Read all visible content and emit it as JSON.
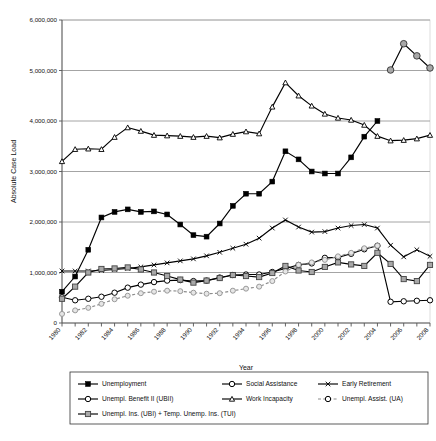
{
  "chart_data": {
    "type": "line",
    "title": "",
    "xlabel": "Year",
    "ylabel": "Absolute Case Load",
    "xlim": [
      1980,
      2008
    ],
    "ylim": [
      0,
      6000000
    ],
    "grid": true,
    "legend_position": "bottom",
    "y_ticks": [
      0,
      1000000,
      2000000,
      3000000,
      4000000,
      5000000,
      6000000
    ],
    "y_tick_labels": [
      "0",
      "1,000,000",
      "2,000,000",
      "3,000,000",
      "4,000,000",
      "5,000,000",
      "6,000,000"
    ],
    "x_ticks": [
      1980,
      1981,
      1982,
      1983,
      1984,
      1985,
      1986,
      1987,
      1988,
      1989,
      1990,
      1991,
      1992,
      1993,
      1994,
      1995,
      1996,
      1997,
      1998,
      1999,
      2000,
      2001,
      2002,
      2003,
      2004,
      2005,
      2006,
      2007,
      2008
    ],
    "x_tick_labels": [
      "1980",
      "1982",
      "1984",
      "1986",
      "1988",
      "1990",
      "1992",
      "1994",
      "1996",
      "1998",
      "2000",
      "2002",
      "2004",
      "2006",
      "2008"
    ],
    "x_labeled_years": [
      1980,
      1982,
      1984,
      1986,
      1988,
      1990,
      1992,
      1994,
      1996,
      1998,
      2000,
      2002,
      2004,
      2006,
      2008
    ],
    "series": [
      {
        "name": "Unemployment",
        "marker": "filled-square",
        "dash": "none",
        "color": "#000000",
        "x": [
          1980,
          1981,
          1982,
          1983,
          1984,
          1985,
          1986,
          1987,
          1988,
          1989,
          1990,
          1991,
          1992,
          1993,
          1994,
          1995,
          1996,
          1997,
          1998,
          1999,
          2000,
          2001,
          2002,
          2003,
          2004
        ],
        "values": [
          620000,
          920000,
          1450000,
          2090000,
          2200000,
          2250000,
          2200000,
          2210000,
          2150000,
          1950000,
          1740000,
          1710000,
          1970000,
          2320000,
          2560000,
          2560000,
          2800000,
          3400000,
          3240000,
          3000000,
          2960000,
          2960000,
          3280000,
          3690000,
          4000000
        ]
      },
      {
        "name": "Social Assistance",
        "marker": "open-circle",
        "dash": "none",
        "color": "#000000",
        "x": [
          1980,
          1981,
          1982,
          1983,
          1984,
          1985,
          1986,
          1987,
          1988,
          1989,
          1990,
          1991,
          1992,
          1993,
          1994,
          1995,
          1996,
          1997,
          1998,
          1999,
          2000,
          2001,
          2002,
          2003,
          2004,
          2005,
          2006,
          2007,
          2008
        ],
        "values": [
          510000,
          450000,
          480000,
          520000,
          600000,
          700000,
          760000,
          810000,
          840000,
          850000,
          830000,
          840000,
          900000,
          950000,
          960000,
          960000,
          1010000,
          1080000,
          1150000,
          1180000,
          1290000,
          1300000,
          1370000,
          1460000,
          1530000,
          420000,
          430000,
          440000,
          450000
        ]
      },
      {
        "name": "Early Retirement",
        "marker": "cross-bar",
        "dash": "none",
        "color": "#000000",
        "x": [
          1980,
          1981,
          1982,
          1983,
          1984,
          1985,
          1986,
          1987,
          1988,
          1989,
          1990,
          1991,
          1992,
          1993,
          1994,
          1995,
          1996,
          1997,
          1998,
          1999,
          2000,
          2001,
          2002,
          2003,
          2004,
          2005,
          2006,
          2007,
          2008
        ],
        "values": [
          1030000,
          1030000,
          1030000,
          1040000,
          1060000,
          1080000,
          1110000,
          1150000,
          1190000,
          1230000,
          1270000,
          1330000,
          1400000,
          1480000,
          1560000,
          1680000,
          1880000,
          2040000,
          1900000,
          1800000,
          1810000,
          1880000,
          1930000,
          1950000,
          1880000,
          1540000,
          1310000,
          1450000,
          1320000
        ]
      },
      {
        "name": "Unempl. Benefit II (UBII)",
        "marker": "gray-circle",
        "dash": "none",
        "color": "#000000",
        "x": [
          2005,
          2006,
          2007,
          2008
        ],
        "values": [
          5010000,
          5530000,
          5290000,
          5050000
        ]
      },
      {
        "name": "Work Incapacity",
        "marker": "small-open-square",
        "dash": "none",
        "color": "#000000",
        "x": [
          1980,
          1981,
          1982,
          1983,
          1984,
          1985,
          1986,
          1987,
          1988,
          1989,
          1990,
          1991,
          1992,
          1993,
          1994,
          1995,
          1996,
          1997,
          1998,
          1999,
          2000,
          2001,
          2002,
          2003,
          2004,
          2005,
          2006,
          2007,
          2008
        ],
        "values": [
          3200000,
          3440000,
          3450000,
          3440000,
          3680000,
          3870000,
          3800000,
          3720000,
          3710000,
          3700000,
          3680000,
          3700000,
          3670000,
          3740000,
          3790000,
          3750000,
          4280000,
          4760000,
          4500000,
          4300000,
          4140000,
          4060000,
          4020000,
          3920000,
          3700000,
          3610000,
          3620000,
          3650000,
          3720000
        ]
      },
      {
        "name": "Unempl. Assist. (UA)",
        "marker": "gray-circle-small",
        "dash": "dashed",
        "color": "#000000",
        "x": [
          1980,
          1981,
          1982,
          1983,
          1984,
          1985,
          1986,
          1987,
          1988,
          1989,
          1990,
          1991,
          1992,
          1993,
          1994,
          1995,
          1996,
          1997,
          1998,
          1999,
          2000,
          2001,
          2002,
          2003,
          2004
        ],
        "values": [
          180000,
          250000,
          300000,
          380000,
          470000,
          540000,
          590000,
          620000,
          640000,
          630000,
          600000,
          580000,
          590000,
          640000,
          680000,
          720000,
          830000,
          1020000,
          1150000,
          1200000,
          1250000,
          1320000,
          1390000,
          1480000,
          1530000
        ]
      },
      {
        "name": "Unempl. Ins. (UBI) + Temp. Unemp. Ins. (TUI)",
        "marker": "gray-square",
        "dash": "none",
        "color": "#000000",
        "x": [
          1980,
          1981,
          1982,
          1983,
          1984,
          1985,
          1986,
          1987,
          1988,
          1989,
          1990,
          1991,
          1992,
          1993,
          1994,
          1995,
          1996,
          1997,
          1998,
          1999,
          2000,
          2001,
          2002,
          2003,
          2004,
          2005,
          2006,
          2007,
          2008
        ],
        "values": [
          480000,
          720000,
          1000000,
          1070000,
          1080000,
          1100000,
          1060000,
          1000000,
          930000,
          860000,
          800000,
          840000,
          890000,
          950000,
          930000,
          910000,
          990000,
          1130000,
          1040000,
          1010000,
          1110000,
          1200000,
          1160000,
          1130000,
          1390000,
          1170000,
          870000,
          830000,
          1150000
        ]
      }
    ]
  },
  "legend": {
    "rows": [
      [
        {
          "label": "Unemployment",
          "marker": "filled-square",
          "dash": "none"
        },
        {
          "label": "Social Assistance",
          "marker": "open-circle",
          "dash": "none"
        },
        {
          "label": "Early Retirement",
          "marker": "cross-bar",
          "dash": "none"
        }
      ],
      [
        {
          "label": "Unempl. Benefit II (UBII)",
          "marker": "open-circle",
          "dash": "none"
        },
        {
          "label": "Work Incapacity",
          "marker": "small-open-square",
          "dash": "none"
        },
        {
          "label": "Unempl. Assist. (UA)",
          "marker": "open-circle",
          "dash": "dashed"
        }
      ],
      [
        {
          "label": "Unempl. Ins. (UBI) + Temp. Unemp. Ins. (TUI)",
          "marker": "gray-square",
          "dash": "none"
        }
      ]
    ]
  },
  "colors": {
    "axis": "#555555",
    "grid": "#9a9a9a",
    "line": "#000000",
    "gray_marker": "#a8a8a8",
    "light_gray_marker": "#c9c9c9",
    "background": "#ffffff"
  }
}
